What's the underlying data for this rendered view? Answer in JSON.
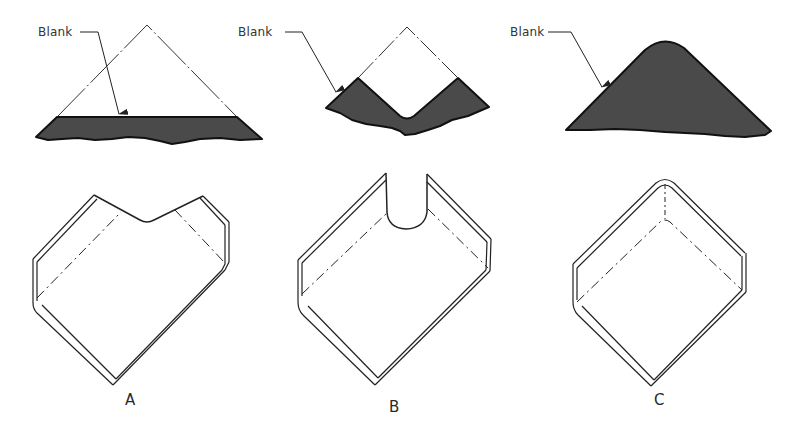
{
  "figure": {
    "panels": [
      {
        "id": "A",
        "caption": "A",
        "blank_label": "Blank",
        "blank_shape": "triangle-corner-notch-flat",
        "formed_part": "channel-corner-with-v-relief"
      },
      {
        "id": "B",
        "caption": "B",
        "blank_label": "Blank",
        "blank_shape": "v-notch-with-round-bottom",
        "formed_part": "channel-corner-with-round-relief"
      },
      {
        "id": "C",
        "caption": "C",
        "blank_label": "Blank",
        "blank_shape": "rounded-triangle-full-corner",
        "formed_part": "channel-corner-closed-radius"
      }
    ],
    "colors": {
      "background": "#ffffff",
      "line": "#222222",
      "blank_fill": "#4a4a4a",
      "text": "#333333"
    }
  }
}
